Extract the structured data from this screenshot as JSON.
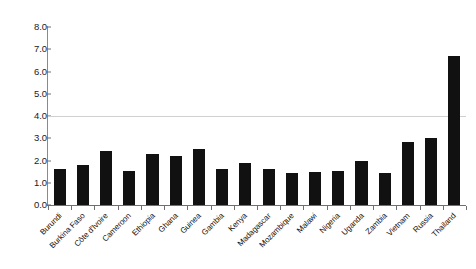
{
  "chart_data": {
    "type": "bar",
    "title": "",
    "subtitle": "",
    "xlabel": "",
    "ylabel": "",
    "ylim": [
      0.0,
      8.0
    ],
    "ytick_step": 1.0,
    "yticks": [
      "0.0",
      "1.0",
      "2.0",
      "3.0",
      "4.0",
      "5.0",
      "6.0",
      "7.0",
      "8.0"
    ],
    "ytick_values": [
      0.0,
      1.0,
      2.0,
      3.0,
      4.0,
      5.0,
      6.0,
      7.0,
      8.0
    ],
    "grid": "single horizontal rule at y = 4.0",
    "gridlines": [
      4.0
    ],
    "legend": "none",
    "legend_position": "none",
    "bar_color": "#111111",
    "axis_color": "#6f6f6f",
    "gridline_color": "#d0d0d0",
    "background_color": "#ffffff",
    "categories": [
      "Burundi",
      "Burkina Faso",
      "Côte d'Ivoire",
      "Cameroon",
      "Ethiopia",
      "Ghana",
      "Guinea",
      "Gambia",
      "Kenya",
      "Madagascar",
      "Mozambique",
      "Malawi",
      "Nigeria",
      "Uganda",
      "Zambia",
      "Vietnam",
      "Russia",
      "Thailand"
    ],
    "values": [
      1.6,
      1.8,
      2.45,
      1.55,
      2.3,
      2.2,
      2.5,
      1.6,
      1.9,
      1.6,
      1.45,
      1.5,
      1.55,
      2.0,
      1.45,
      2.85,
      3.0,
      6.7
    ],
    "series": [
      {
        "name": "",
        "values": [
          1.6,
          1.8,
          2.45,
          1.55,
          2.3,
          2.2,
          2.5,
          1.6,
          1.9,
          1.6,
          1.45,
          1.5,
          1.55,
          2.0,
          1.45,
          2.85,
          3.0,
          6.7
        ]
      }
    ],
    "annotations": [],
    "xtick_label_rotation": -45
  }
}
